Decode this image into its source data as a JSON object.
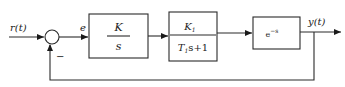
{
  "diagram": {
    "type": "control-loop-block-diagram",
    "input_label": "r(t)",
    "error_label": "e",
    "output_label": "y(t)",
    "feedback_sign": "−",
    "blocks": [
      {
        "name": "integrator",
        "numerator": "K",
        "denominator": "s"
      },
      {
        "name": "first-order-lag",
        "numerator": "K",
        "numerator_sub": "1",
        "denominator_T": "T",
        "denominator_T_sub": "1",
        "denominator_rest": "s+1"
      },
      {
        "name": "time-delay",
        "base": "e",
        "exponent": "−s"
      }
    ]
  }
}
